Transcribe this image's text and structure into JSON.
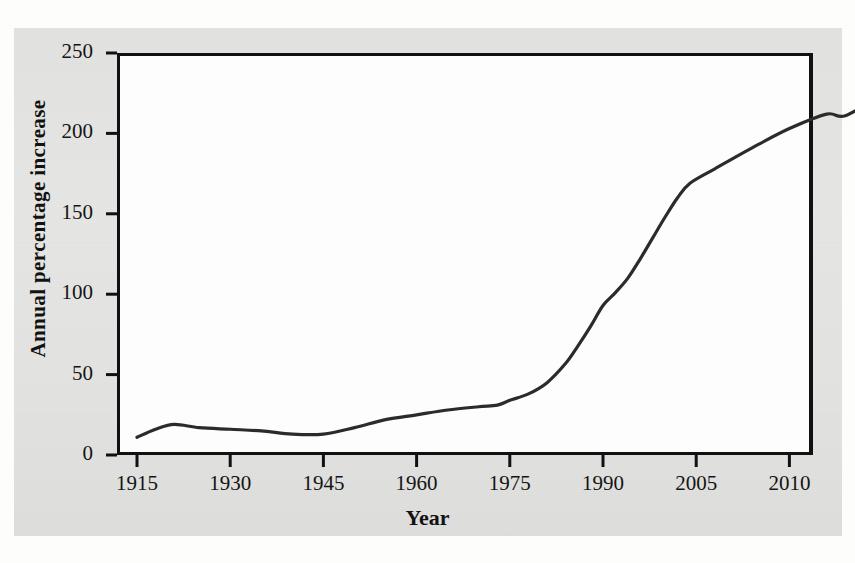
{
  "figure": {
    "background_color": "#e4e4e2",
    "plot_background_color": "#fdfdfd",
    "line_color": "#2b2b2b",
    "axis_color": "#111111"
  },
  "chart_data": {
    "type": "line",
    "title": "",
    "xlabel": "Year",
    "ylabel": "Annual percentage increase",
    "xtick_labels": [
      "1915",
      "1930",
      "1945",
      "1960",
      "1975",
      "1990",
      "2005",
      "2010"
    ],
    "ytick_labels": [
      "0",
      "50",
      "100",
      "150",
      "200",
      "250"
    ],
    "ylim": [
      0,
      250
    ],
    "grid": false,
    "legend": null,
    "series": [
      {
        "name": "Annual percentage increase",
        "points": [
          [
            1915,
            11
          ],
          [
            1918,
            16
          ],
          [
            1921,
            19
          ],
          [
            1925,
            17
          ],
          [
            1930,
            16
          ],
          [
            1935,
            15
          ],
          [
            1940,
            13
          ],
          [
            1945,
            13
          ],
          [
            1950,
            17
          ],
          [
            1955,
            22
          ],
          [
            1960,
            25
          ],
          [
            1965,
            28
          ],
          [
            1970,
            30
          ],
          [
            1973,
            31
          ],
          [
            1975,
            34
          ],
          [
            1978,
            38
          ],
          [
            1981,
            45
          ],
          [
            1984,
            57
          ],
          [
            1986,
            68
          ],
          [
            1988,
            80
          ],
          [
            1990,
            93
          ],
          [
            1992,
            101
          ],
          [
            1994,
            110
          ],
          [
            1996,
            122
          ],
          [
            1998,
            135
          ],
          [
            2000,
            148
          ],
          [
            2002,
            160
          ],
          [
            2004,
            169
          ],
          [
            2006,
            178
          ],
          [
            2008,
            191
          ],
          [
            2010,
            203
          ],
          [
            2012,
            212
          ],
          [
            2013,
            211
          ],
          [
            2015,
            224
          ]
        ]
      }
    ]
  }
}
